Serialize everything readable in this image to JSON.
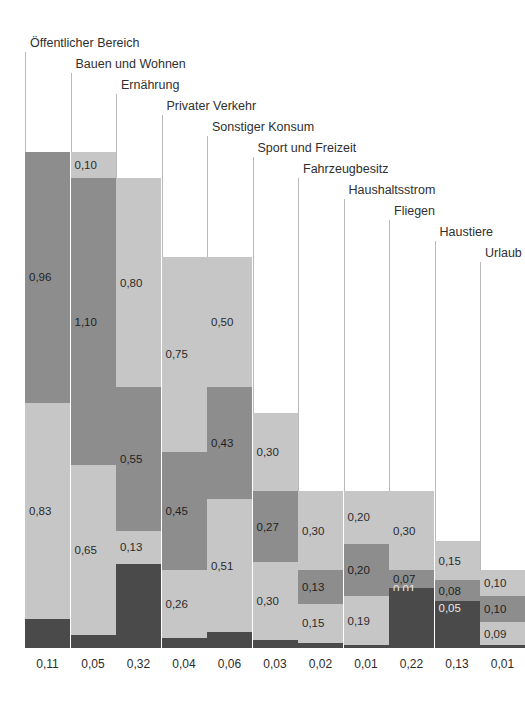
{
  "chart_data": {
    "type": "bar",
    "subtype": "stacked-bar",
    "title": "",
    "xlabel": "",
    "ylabel": "",
    "grid": false,
    "legend": "none",
    "axis_visible": false,
    "value_format": "german-decimal-comma",
    "colors": {
      "light": "#c6c6c6",
      "medium": "#8d8d8d",
      "dark": "#4a4a4a",
      "leader_line": "#b9b9b9",
      "background": "#ffffff",
      "text": "#2b2b2b"
    },
    "categories": [
      "Öffentlicher Bereich",
      "Bauen und Wohnen",
      "Ernährung",
      "Privater Verkehr",
      "Sonstiger Konsum",
      "Sport und Freizeit",
      "Fahrzeugbesitz",
      "Haushaltsstrom",
      "Fliegen",
      "Haustiere",
      "Urlaub"
    ],
    "bottom_values": [
      "0,11",
      "0,05",
      "0,32",
      "0,04",
      "0,06",
      "0,03",
      "0,02",
      "0,01",
      "0,22",
      "0,13",
      "0,01"
    ],
    "bars": [
      {
        "category": "Öffentlicher Bereich",
        "total": 1.9,
        "segments": [
          {
            "label": "0,96",
            "value": 0.96,
            "tone": "medium"
          },
          {
            "label": "0,83",
            "value": 0.83,
            "tone": "light"
          },
          {
            "label": "0,11",
            "value": 0.11,
            "tone": "dark",
            "label_below": true
          }
        ]
      },
      {
        "category": "Bauen und Wohnen",
        "total": 1.9,
        "segments": [
          {
            "label": "0,10",
            "value": 0.1,
            "tone": "light"
          },
          {
            "label": "1,10",
            "value": 1.1,
            "tone": "medium"
          },
          {
            "label": "0,65",
            "value": 0.65,
            "tone": "light"
          },
          {
            "label": "0,05",
            "value": 0.05,
            "tone": "dark",
            "label_below": true
          }
        ]
      },
      {
        "category": "Ernährung",
        "total": 1.8,
        "segments": [
          {
            "label": "0,80",
            "value": 0.8,
            "tone": "light"
          },
          {
            "label": "0,55",
            "value": 0.55,
            "tone": "medium"
          },
          {
            "label": "0,13",
            "value": 0.13,
            "tone": "light"
          },
          {
            "label": "0,32",
            "value": 0.32,
            "tone": "dark",
            "label_below": true
          }
        ]
      },
      {
        "category": "Privater Verkehr",
        "total": 1.5,
        "segments": [
          {
            "label": "0,75",
            "value": 0.75,
            "tone": "light"
          },
          {
            "label": "0,45",
            "value": 0.45,
            "tone": "medium"
          },
          {
            "label": "0,26",
            "value": 0.26,
            "tone": "light"
          },
          {
            "label": "0,04",
            "value": 0.04,
            "tone": "dark",
            "label_below": true
          }
        ]
      },
      {
        "category": "Sonstiger Konsum",
        "total": 1.5,
        "segments": [
          {
            "label": "0,50",
            "value": 0.5,
            "tone": "light"
          },
          {
            "label": "0,43",
            "value": 0.43,
            "tone": "medium"
          },
          {
            "label": "0,51",
            "value": 0.51,
            "tone": "light"
          },
          {
            "label": "0,06",
            "value": 0.06,
            "tone": "dark",
            "label_below": true
          }
        ]
      },
      {
        "category": "Sport und Freizeit",
        "total": 0.9,
        "segments": [
          {
            "label": "0,30",
            "value": 0.3,
            "tone": "light"
          },
          {
            "label": "0,27",
            "value": 0.27,
            "tone": "medium"
          },
          {
            "label": "0,30",
            "value": 0.3,
            "tone": "light"
          },
          {
            "label": "0,03",
            "value": 0.03,
            "tone": "dark",
            "label_below": true
          }
        ]
      },
      {
        "category": "Fahrzeugbesitz",
        "total": 0.6,
        "segments": [
          {
            "label": "0,30",
            "value": 0.3,
            "tone": "light"
          },
          {
            "label": "0,13",
            "value": 0.13,
            "tone": "medium"
          },
          {
            "label": "0,15",
            "value": 0.15,
            "tone": "light"
          },
          {
            "label": "0,02",
            "value": 0.02,
            "tone": "dark",
            "label_below": true
          }
        ]
      },
      {
        "category": "Haushaltsstrom",
        "total": 0.6,
        "segments": [
          {
            "label": "0,20",
            "value": 0.2,
            "tone": "light"
          },
          {
            "label": "0,20",
            "value": 0.2,
            "tone": "medium"
          },
          {
            "label": "0,19",
            "value": 0.19,
            "tone": "light"
          },
          {
            "label": "0,01",
            "value": 0.01,
            "tone": "dark",
            "label_below": true
          }
        ]
      },
      {
        "category": "Fliegen",
        "total": 0.6,
        "segments": [
          {
            "label": "0,30",
            "value": 0.3,
            "tone": "light"
          },
          {
            "label": "0,07",
            "value": 0.07,
            "tone": "medium"
          },
          {
            "label": "0,01",
            "value": 0.01,
            "tone": "dark"
          },
          {
            "label": "0,22",
            "value": 0.22,
            "tone": "dark",
            "label_below": true
          }
        ]
      },
      {
        "category": "Haustiere",
        "total": 0.41,
        "segments": [
          {
            "label": "0,15",
            "value": 0.15,
            "tone": "light"
          },
          {
            "label": "0,08",
            "value": 0.08,
            "tone": "medium"
          },
          {
            "label": "0,05",
            "value": 0.05,
            "tone": "dark"
          },
          {
            "label": "0,13",
            "value": 0.13,
            "tone": "dark",
            "label_below": true
          }
        ]
      },
      {
        "category": "Urlaub",
        "total": 0.3,
        "segments": [
          {
            "label": "0,10",
            "value": 0.1,
            "tone": "light"
          },
          {
            "label": "0,10",
            "value": 0.1,
            "tone": "medium"
          },
          {
            "label": "0,09",
            "value": 0.09,
            "tone": "light"
          },
          {
            "label": "0,01",
            "value": 0.01,
            "tone": "dark",
            "label_below": true
          }
        ]
      }
    ]
  },
  "layout": {
    "bar_width": 45,
    "bar_gap": 45.5,
    "first_bar_x": 25,
    "baseline_y": 648,
    "unit_px": 261,
    "label_start_y": 46,
    "label_step_y": 21
  }
}
